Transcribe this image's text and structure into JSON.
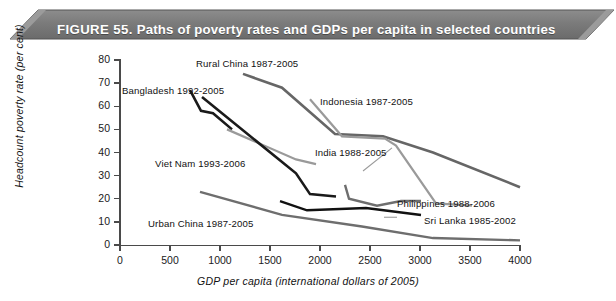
{
  "figure": {
    "number_label": "FIGURE 55.",
    "title": "Paths of poverty rates and GDPs per capita in selected countries",
    "banner_color": "#7a7a7a",
    "banner_text_color": "#ffffff"
  },
  "axes": {
    "y_title": "Headcount poverty rate (per cent)",
    "x_title": "GDP per capita (international dollars of 2005)",
    "y_ticks": [
      "0",
      "10",
      "20",
      "30",
      "40",
      "50",
      "60",
      "70",
      "80"
    ],
    "x_ticks": [
      "0",
      "500",
      "1000",
      "1500",
      "2000",
      "2500",
      "3000",
      "3500",
      "4000"
    ],
    "ylim": [
      0,
      80
    ],
    "xlim": [
      0,
      4000
    ]
  },
  "labels": {
    "rural_china": "Rural China  1987-2005",
    "bangladesh": "Bangladesh  1992-2005",
    "indonesia": "Indonesia  1987-2005",
    "india": "India  1988-2005",
    "viet_nam": "Viet Nam  1993-2006",
    "philippines": "Philippines  1988-2006",
    "sri_lanka": "Sri Lanka  1985-2002",
    "urban_china": "Urban China  1987-2005"
  },
  "chart_data": {
    "type": "line",
    "title": "Paths of poverty rates and GDPs per capita in selected countries",
    "xlabel": "GDP per capita (international dollars of 2005)",
    "ylabel": "Headcount poverty rate (per cent)",
    "xlim": [
      0,
      4000
    ],
    "ylim": [
      0,
      80
    ],
    "xticks": [
      0,
      500,
      1000,
      1500,
      2000,
      2500,
      3000,
      3500,
      4000
    ],
    "yticks": [
      0,
      10,
      20,
      30,
      40,
      50,
      60,
      70,
      80
    ],
    "grid": false,
    "legend": "inline-annotations",
    "series": [
      {
        "name": "Rural China  1987-2005",
        "color": "#666666",
        "width": 2.6,
        "points": [
          [
            1230,
            74
          ],
          [
            1620,
            68
          ],
          [
            2150,
            48
          ],
          [
            2630,
            47
          ],
          [
            3130,
            40
          ],
          [
            4000,
            25
          ]
        ]
      },
      {
        "name": "Bangladesh  1992-2005",
        "color": "#1a1a1a",
        "width": 2.6,
        "points": [
          [
            700,
            67
          ],
          [
            810,
            58
          ],
          [
            930,
            57
          ],
          [
            1120,
            50
          ]
        ]
      },
      {
        "name": "Indonesia  1987-2005",
        "color": "#9a9a9a",
        "width": 2.2,
        "points": [
          [
            1900,
            63
          ],
          [
            2220,
            47
          ],
          [
            2650,
            46
          ],
          [
            2760,
            43
          ],
          [
            3160,
            18
          ],
          [
            3520,
            17
          ]
        ]
      },
      {
        "name": "India  1988-2005",
        "color": "#9a9a9a",
        "width": 2.2,
        "points": [
          [
            1070,
            50
          ],
          [
            1760,
            37
          ],
          [
            1960,
            35
          ]
        ]
      },
      {
        "name": "Viet Nam  1993-2006",
        "color": "#1a1a1a",
        "width": 2.6,
        "points": [
          [
            820,
            64
          ],
          [
            1760,
            31
          ],
          [
            1900,
            22
          ],
          [
            2160,
            21
          ]
        ]
      },
      {
        "name": "Philippines  1988-2006",
        "color": "#6e6e6e",
        "width": 2.4,
        "points": [
          [
            2250,
            26
          ],
          [
            2290,
            20
          ],
          [
            2570,
            17
          ],
          [
            2810,
            19
          ],
          [
            3010,
            19
          ]
        ]
      },
      {
        "name": "Sri Lanka  1985-2002",
        "color": "#111111",
        "width": 2.4,
        "points": [
          [
            1600,
            19
          ],
          [
            1870,
            15
          ],
          [
            2460,
            16
          ],
          [
            3010,
            13
          ]
        ]
      },
      {
        "name": "Urban China  1987-2005",
        "color": "#6e6e6e",
        "width": 2.4,
        "points": [
          [
            800,
            23
          ],
          [
            1620,
            13
          ],
          [
            2420,
            8
          ],
          [
            3130,
            3
          ],
          [
            4000,
            2
          ]
        ]
      }
    ],
    "leader_lines": [
      {
        "name": "indonesia-leader",
        "color": "#9a9a9a",
        "width": 1.1,
        "points": [
          [
            2430,
            32
          ],
          [
            2720,
            42
          ]
        ]
      },
      {
        "name": "philippines-leader",
        "color": "#9a9a9a",
        "width": 1.1,
        "points": [
          [
            2640,
            12
          ],
          [
            2770,
            12
          ]
        ]
      }
    ]
  }
}
